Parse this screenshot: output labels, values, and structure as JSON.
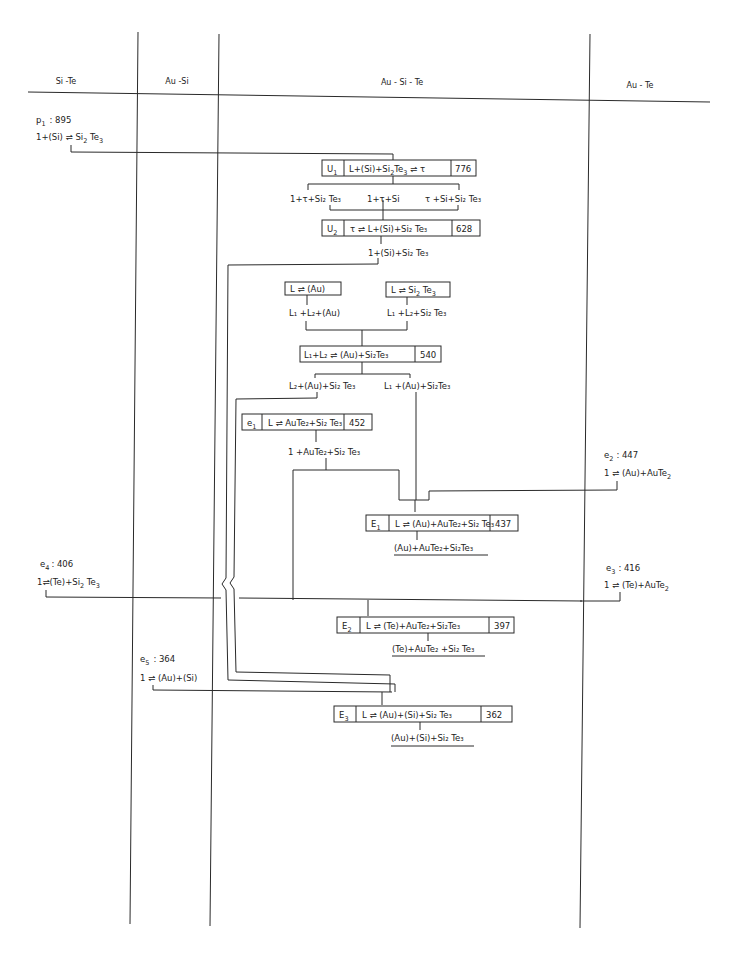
{
  "columns": {
    "si_te": "Si -Te",
    "au_si": "Au -Si",
    "au_si_te": "Au - Si - Te",
    "au_te": "Au - Te"
  },
  "binary_invariants": {
    "p1": {
      "label": "p",
      "sub": "1",
      "temp": ": 895",
      "reaction": [
        "1+(Si) ⇌ Si",
        "2",
        " Te",
        "3"
      ]
    },
    "e2": {
      "label": "e",
      "sub": "2",
      "temp": ": 447",
      "reaction": [
        "1  ⇌ (Au)+AuTe",
        "2"
      ]
    },
    "e3": {
      "label": "e",
      "sub": "3",
      "temp": ": 416",
      "reaction": [
        "1 ⇌ (Te)+AuTe",
        "2"
      ]
    },
    "e4": {
      "label": "e",
      "sub": "4",
      "temp": ": 406",
      "reaction": [
        "1⇌(Te)+Si",
        "2",
        " Te",
        "3"
      ]
    },
    "e5": {
      "label": "e",
      "sub": "5",
      "temp": ": 364",
      "reaction": [
        "1 ⇌ (Au)+(Si)"
      ]
    }
  },
  "ternary_invariants": [
    {
      "id": "U",
      "sub": "1",
      "reaction": "L+(Si)+Si₂Te₃ ⇌ τ",
      "temp": "776"
    },
    {
      "id": "U",
      "sub": "2",
      "reaction": "τ ⇌ L+(Si)+Si₂ Te₃",
      "temp": "628"
    },
    {
      "id": "",
      "sub": "",
      "reaction": "L ⇌ (Au)",
      "temp": ""
    },
    {
      "id": "",
      "sub": "",
      "reaction": "L ⇌ Si₂ Te₃",
      "temp": ""
    },
    {
      "id": "",
      "sub": "",
      "reaction": "L₁+L₂ ⇌ (Au)+Si₂Te₃",
      "temp": "540"
    },
    {
      "id": "e",
      "sub": "1",
      "reaction": "L ⇌ AuTe₂+Si₂ Te₃",
      "temp": "452"
    },
    {
      "id": "E",
      "sub": "1",
      "reaction": "L ⇌ (Au)+AuTe₂+Si₂ Te₃",
      "temp": "437"
    },
    {
      "id": "E",
      "sub": "2",
      "reaction": "L ⇌ (Te)+AuTe₂+Si₂Te₃",
      "temp": "397"
    },
    {
      "id": "E",
      "sub": "3",
      "reaction": "L ⇌ (Au)+(Si)+Si₂ Te₃",
      "temp": "362"
    }
  ],
  "phase_fields": {
    "after_u1_left": "1+τ+Si₂ Te₃",
    "after_u1_mid": "1+τ+Si",
    "after_u1_right": "τ +Si+Si₂ Te₃",
    "after_u2": "1+(Si)+Si₂ Te₃",
    "after_l_au": "L₁ +L₂+(Au)",
    "after_l_si2te3": "L₁ +L₂+Si₂ Te₃",
    "after_540_left": "L₂+(Au)+Si₂ Te₃",
    "after_540_right": "L₁ +(Au)+Si₂Te₃",
    "after_e1": "1 +AuTe₂+Si₂ Te₃",
    "after_E1": "(Au)+AuTe₂+Si₂Te₃",
    "after_E2": "(Te)+AuTe₂ +Si₂ Te₃",
    "after_E3": "(Au)+(Si)+Si₂ Te₃"
  }
}
